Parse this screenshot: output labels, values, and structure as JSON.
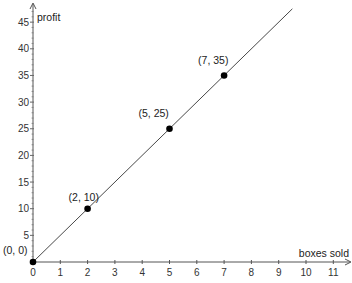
{
  "chart_data": {
    "type": "line",
    "title": "",
    "xlabel": "boxes sold",
    "ylabel": "profit",
    "xlim": [
      0,
      11.7
    ],
    "ylim": [
      0,
      47
    ],
    "x_ticks": [
      0,
      1,
      2,
      3,
      4,
      5,
      6,
      7,
      8,
      9,
      10,
      11
    ],
    "y_ticks": [
      5,
      10,
      15,
      20,
      25,
      30,
      35,
      40,
      45
    ],
    "y_minor_step": 1,
    "grid": false,
    "legend": null,
    "series": [
      {
        "name": "profit = 5 × boxes sold",
        "type": "line",
        "slope": 5,
        "intercept": 0,
        "x": [
          0,
          9.5
        ],
        "y": [
          0,
          47.5
        ],
        "color": "#333333"
      },
      {
        "name": "labeled points",
        "type": "scatter",
        "points": [
          {
            "x": 0,
            "y": 0,
            "label": "(0, 0)"
          },
          {
            "x": 2,
            "y": 10,
            "label": "(2, 10)"
          },
          {
            "x": 5,
            "y": 25,
            "label": "(5, 25)"
          },
          {
            "x": 7,
            "y": 35,
            "label": "(7, 35)"
          }
        ],
        "color": "#000000"
      }
    ]
  }
}
